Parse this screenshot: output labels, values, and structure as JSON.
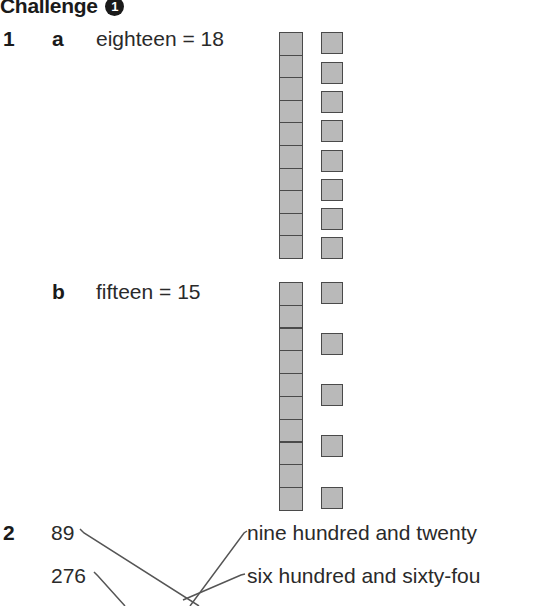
{
  "heading": {
    "title": "Challenge",
    "badge": "1"
  },
  "q1": {
    "number": "1",
    "a": {
      "label": "a",
      "text": "eighteen = 18",
      "tens": 1,
      "ones": 8
    },
    "b": {
      "label": "b",
      "text": "fifteen = 15",
      "tens": 1,
      "ones": 5
    }
  },
  "q2": {
    "number": "2",
    "left_numbers": [
      "89",
      "276"
    ],
    "right_words": [
      "nine hundred and twenty",
      "six hundred and sixty-fou"
    ]
  },
  "colors": {
    "block_fill": "#b9b9b9",
    "block_border": "#4a4a4a",
    "line": "#555555"
  }
}
